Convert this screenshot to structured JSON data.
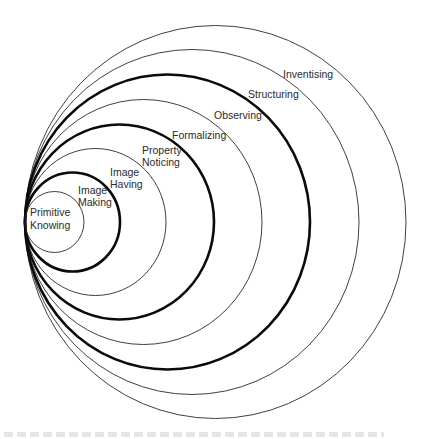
{
  "figure": {
    "type": "nested-tangent-circles",
    "tangent_point": {
      "x": 25,
      "y": 222
    },
    "rings": [
      {
        "id": "primitive-knowing",
        "label_lines": [
          "Primitive",
          "Knowing"
        ],
        "rx": 29.5,
        "ry": 30.5,
        "weight": "thin",
        "label_pos": [
          {
            "x": 30,
            "y": 216
          },
          {
            "x": 30,
            "y": 229
          }
        ]
      },
      {
        "id": "image-making",
        "label_lines": [
          "Image",
          "Making"
        ],
        "rx": 47.5,
        "ry": 49.5,
        "weight": "thick",
        "label_pos": [
          {
            "x": 78,
            "y": 194
          },
          {
            "x": 78,
            "y": 206
          }
        ]
      },
      {
        "id": "image-having",
        "label_lines": [
          "Image",
          "Having"
        ],
        "rx": 70.5,
        "ry": 73.5,
        "weight": "thin",
        "label_pos": [
          {
            "x": 110,
            "y": 176
          },
          {
            "x": 110,
            "y": 188
          }
        ]
      },
      {
        "id": "property-noticing",
        "label_lines": [
          "Property",
          "Noticing"
        ],
        "rx": 94.5,
        "ry": 97.5,
        "weight": "thick",
        "label_pos": [
          {
            "x": 142,
            "y": 154
          },
          {
            "x": 142,
            "y": 166
          }
        ]
      },
      {
        "id": "formalizing",
        "label_lines": [
          "Formalizing"
        ],
        "rx": 118.5,
        "ry": 122.5,
        "weight": "thin",
        "label_pos": [
          {
            "x": 172,
            "y": 139
          }
        ]
      },
      {
        "id": "observing",
        "label_lines": [
          "Observing"
        ],
        "rx": 142.5,
        "ry": 147.5,
        "weight": "thick",
        "label_pos": [
          {
            "x": 214,
            "y": 119
          }
        ]
      },
      {
        "id": "structuring",
        "label_lines": [
          "Structuring"
        ],
        "rx": 167,
        "ry": 172.5,
        "weight": "thin",
        "label_pos": [
          {
            "x": 248,
            "y": 98
          }
        ]
      },
      {
        "id": "inventising",
        "label_lines": [
          "Inventising"
        ],
        "rx": 190.5,
        "ry": 196.5,
        "weight": "thin",
        "label_pos": [
          {
            "x": 283,
            "y": 78
          }
        ]
      }
    ]
  },
  "colors": {
    "background": "#ffffff",
    "stroke": "#0a0a0a",
    "label_text": "#2b2b2b"
  }
}
